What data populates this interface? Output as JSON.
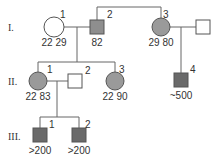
{
  "diagram": {
    "type": "pedigree",
    "colors": {
      "unaffected": "#ffffff",
      "affected_light": "#9a9a9a",
      "affected_dark": "#6a6a6a",
      "line": "#666666"
    },
    "generations": [
      {
        "label": "I.",
        "individuals": [
          {
            "id": "I-1",
            "number": "1",
            "sex": "female",
            "status": "unaffected",
            "values": "22 29"
          },
          {
            "id": "I-2",
            "number": "2",
            "sex": "male",
            "status": "affected",
            "values": "82"
          },
          {
            "id": "I-3",
            "number": "3",
            "sex": "female",
            "status": "affected",
            "values": "29 80"
          },
          {
            "id": "I-3-spouse",
            "number": "",
            "sex": "male",
            "status": "unaffected",
            "values": ""
          }
        ]
      },
      {
        "label": "II.",
        "individuals": [
          {
            "id": "II-1",
            "number": "1",
            "sex": "female",
            "status": "affected",
            "values": "22 83"
          },
          {
            "id": "II-2",
            "number": "2",
            "sex": "male",
            "status": "unaffected",
            "values": ""
          },
          {
            "id": "II-3",
            "number": "3",
            "sex": "female",
            "status": "affected",
            "values": "22 90"
          },
          {
            "id": "II-4",
            "number": "4",
            "sex": "male",
            "status": "affected",
            "values": "~500"
          }
        ]
      },
      {
        "label": "III.",
        "individuals": [
          {
            "id": "III-1",
            "number": "1",
            "sex": "male",
            "status": "affected",
            "values": ">200"
          },
          {
            "id": "III-2",
            "number": "2",
            "sex": "male",
            "status": "affected",
            "values": ">200"
          }
        ]
      }
    ],
    "relationships": [
      {
        "type": "sibling",
        "members": [
          "I-2",
          "I-3"
        ]
      },
      {
        "type": "couple",
        "members": [
          "I-1",
          "I-2"
        ],
        "children": [
          "II-1",
          "II-3"
        ]
      },
      {
        "type": "couple",
        "members": [
          "I-3",
          "I-3-spouse"
        ],
        "children": [
          "II-4"
        ]
      },
      {
        "type": "couple",
        "members": [
          "II-1",
          "II-2"
        ],
        "children": [
          "III-1",
          "III-2"
        ]
      }
    ]
  },
  "labels": {
    "gen1": "I.",
    "gen2": "II.",
    "gen3": "III.",
    "i1_num": "1",
    "i1_vals": "22 29",
    "i2_num": "2",
    "i2_vals": "82",
    "i3_num": "3",
    "i3_vals": "29 80",
    "ii1_num": "1",
    "ii1_vals": "22 83",
    "ii2_num": "2",
    "ii3_num": "3",
    "ii3_vals": "22 90",
    "ii4_num": "4",
    "ii4_vals": "~500",
    "iii1_num": "1",
    "iii1_vals": ">200",
    "iii2_num": "2",
    "iii2_vals": ">200"
  }
}
